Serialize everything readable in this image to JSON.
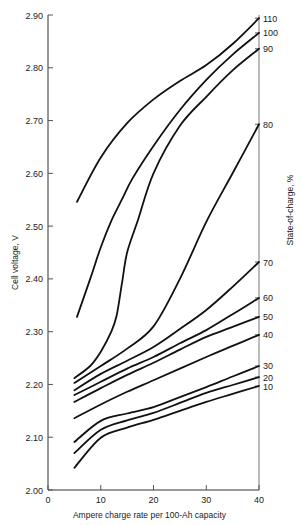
{
  "chart_data": {
    "type": "line",
    "title": "",
    "xlabel": "Ampere charge rate per 100-Ah capacity",
    "ylabel": "Cell voltage, V",
    "y2label": "State-of-charge, %",
    "xlim": [
      0,
      40
    ],
    "ylim": [
      2.0,
      2.9
    ],
    "xticks": [
      0,
      10,
      20,
      30,
      40
    ],
    "xtick_labels": [
      "0",
      "10",
      "20",
      "30",
      "40"
    ],
    "yticks": [
      2.0,
      2.1,
      2.2,
      2.3,
      2.4,
      2.5,
      2.6,
      2.7,
      2.8,
      2.9
    ],
    "ytick_labels": [
      "2.00",
      "2.10",
      "2.20",
      "2.30",
      "2.40",
      "2.50",
      "2.60",
      "2.70",
      "2.80",
      "2.90"
    ],
    "grid": false,
    "legend": "curves labeled at right end with state-of-charge %",
    "series": [
      {
        "name": "110",
        "x": [
          5.5,
          10,
          15,
          20,
          25,
          30,
          35,
          40
        ],
        "values": [
          2.546,
          2.63,
          2.695,
          2.74,
          2.775,
          2.805,
          2.845,
          2.894
        ]
      },
      {
        "name": "100",
        "x": [
          5.5,
          8,
          10,
          12,
          14,
          16,
          20,
          25,
          30,
          35,
          40
        ],
        "values": [
          2.328,
          2.4,
          2.46,
          2.51,
          2.55,
          2.59,
          2.652,
          2.72,
          2.777,
          2.825,
          2.866
        ]
      },
      {
        "name": "90",
        "x": [
          5,
          8,
          10,
          12,
          13,
          14,
          15,
          17,
          20,
          25,
          30,
          35,
          40
        ],
        "values": [
          2.212,
          2.235,
          2.262,
          2.3,
          2.33,
          2.39,
          2.45,
          2.51,
          2.6,
          2.69,
          2.745,
          2.795,
          2.836
        ]
      },
      {
        "name": "80",
        "x": [
          5,
          10,
          15,
          20,
          25,
          30,
          35,
          40
        ],
        "values": [
          2.203,
          2.235,
          2.268,
          2.31,
          2.4,
          2.508,
          2.6,
          2.693
        ]
      },
      {
        "name": "70",
        "x": [
          5,
          10,
          15,
          20,
          25,
          30,
          35,
          40
        ],
        "values": [
          2.189,
          2.22,
          2.245,
          2.271,
          2.305,
          2.341,
          2.385,
          2.432
        ]
      },
      {
        "name": "60",
        "x": [
          5,
          10,
          15,
          20,
          25,
          30,
          35,
          40
        ],
        "values": [
          2.18,
          2.205,
          2.23,
          2.252,
          2.278,
          2.303,
          2.333,
          2.364
        ]
      },
      {
        "name": "50",
        "x": [
          5,
          10,
          15,
          20,
          25,
          30,
          35,
          40
        ],
        "values": [
          2.167,
          2.193,
          2.218,
          2.241,
          2.266,
          2.29,
          2.309,
          2.328
        ]
      },
      {
        "name": "40",
        "x": [
          5,
          10,
          15,
          20,
          25,
          30,
          35,
          40
        ],
        "values": [
          2.136,
          2.162,
          2.186,
          2.208,
          2.23,
          2.252,
          2.273,
          2.294
        ]
      },
      {
        "name": "30",
        "x": [
          5,
          10,
          15,
          20,
          25,
          30,
          35,
          40
        ],
        "values": [
          2.091,
          2.131,
          2.145,
          2.157,
          2.176,
          2.195,
          2.215,
          2.235
        ]
      },
      {
        "name": "20",
        "x": [
          5,
          10,
          15,
          20,
          25,
          30,
          35,
          40
        ],
        "values": [
          2.07,
          2.114,
          2.132,
          2.146,
          2.165,
          2.184,
          2.199,
          2.214
        ]
      },
      {
        "name": "10",
        "x": [
          5,
          10,
          15,
          20,
          25,
          30,
          35,
          40
        ],
        "values": [
          2.042,
          2.099,
          2.118,
          2.133,
          2.15,
          2.167,
          2.182,
          2.197
        ]
      }
    ]
  }
}
